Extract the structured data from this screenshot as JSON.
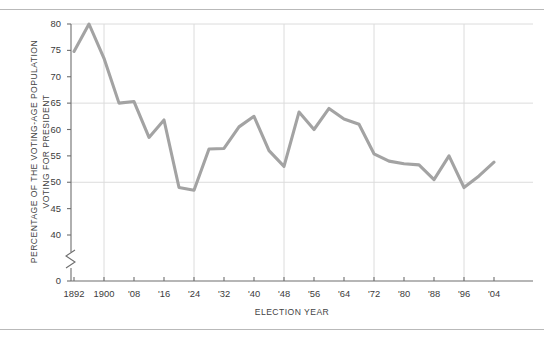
{
  "figure": {
    "background_color": "#ffffff",
    "rule_color": "#b9b9b9",
    "line_color": "#a3a3a3",
    "grid_color": "#dcdcdc",
    "axis_color": "#6e6e6e",
    "text_color": "#3b3b3b"
  },
  "chart_data": {
    "type": "line",
    "title": "",
    "subtitle": "",
    "xlabel": "ELECTION YEAR",
    "ylabel": "PERCENTAGE OF THE VOTING-AGE POPULATION VOTING FOR PRESIDENT",
    "ylabel_line1": "PERCENTAGE OF THE VOTING-AGE POPULATION",
    "ylabel_line2": "VOTING FOR PRESIDENT",
    "grid": true,
    "grid_axis": "both",
    "legend": false,
    "legend_position": "none",
    "axis_break": true,
    "axis_break_note": "y-axis broken between 0 and 40",
    "xlim": [
      1890,
      2006
    ],
    "ylim": [
      40,
      81
    ],
    "yticks": [
      0,
      40,
      45,
      50,
      55,
      60,
      65,
      70,
      75,
      80
    ],
    "ytick_labels": [
      "0",
      "40",
      "45",
      "50",
      "55",
      "60",
      "65",
      "70",
      "75",
      "80"
    ],
    "y_gridlines": [
      50,
      65,
      80
    ],
    "xticks": [
      1892,
      1900,
      1908,
      1916,
      1924,
      1932,
      1940,
      1948,
      1956,
      1964,
      1972,
      1980,
      1988,
      1996,
      2004
    ],
    "xtick_labels": [
      "1892",
      "1900",
      "'08",
      "'16",
      "'24",
      "'32",
      "'40",
      "'48",
      "'56",
      "'64",
      "'72",
      "'80",
      "'88",
      "'96",
      "'04"
    ],
    "x_gridlines": [
      1900,
      1924,
      1948,
      1972,
      1996
    ],
    "x": [
      1892,
      1896,
      1900,
      1904,
      1908,
      1912,
      1916,
      1920,
      1924,
      1928,
      1932,
      1936,
      1940,
      1944,
      1948,
      1952,
      1956,
      1960,
      1964,
      1968,
      1972,
      1976,
      1980,
      1984,
      1988,
      1992,
      1996,
      2000,
      2004
    ],
    "values": [
      74.8,
      80.0,
      73.5,
      65.0,
      65.3,
      58.5,
      61.8,
      49.0,
      48.5,
      56.3,
      56.4,
      60.5,
      62.5,
      56.0,
      53.0,
      63.3,
      60.0,
      64.0,
      62.0,
      61.0,
      55.4,
      54.0,
      53.5,
      53.3,
      50.5,
      55.0,
      49.0,
      51.2,
      53.8
    ]
  },
  "y_axis": {
    "ticks": [
      {
        "label": "80",
        "value": 80
      },
      {
        "label": "75",
        "value": 75
      },
      {
        "label": "70",
        "value": 70
      },
      {
        "label": "65",
        "value": 65
      },
      {
        "label": "60",
        "value": 60
      },
      {
        "label": "55",
        "value": 55
      },
      {
        "label": "50",
        "value": 50
      },
      {
        "label": "45",
        "value": 45
      },
      {
        "label": "40",
        "value": 40
      },
      {
        "label": "0",
        "value": 0
      }
    ]
  },
  "x_axis": {
    "ticks": [
      {
        "label": "1892"
      },
      {
        "label": "1900"
      },
      {
        "label": "'08"
      },
      {
        "label": "'16"
      },
      {
        "label": "'24"
      },
      {
        "label": "'32"
      },
      {
        "label": "'40"
      },
      {
        "label": "'48"
      },
      {
        "label": "'56"
      },
      {
        "label": "'64"
      },
      {
        "label": "'72"
      },
      {
        "label": "'80"
      },
      {
        "label": "'88"
      },
      {
        "label": "'96"
      },
      {
        "label": "'04"
      }
    ]
  }
}
